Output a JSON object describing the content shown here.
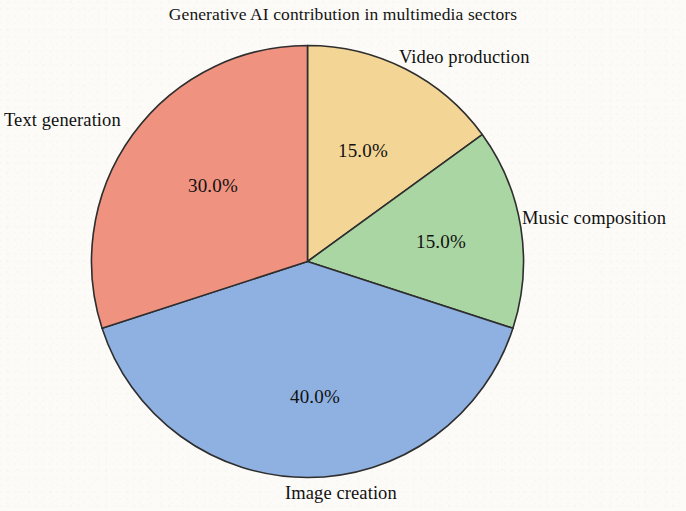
{
  "chart_data": {
    "type": "pie",
    "title": "Generative AI contribution in multimedia sectors",
    "xlabel": "",
    "ylabel": "",
    "legend_position": "none",
    "grid": false,
    "start_angle_deg": 90,
    "direction": "clockwise",
    "categories": [
      "Video production",
      "Music composition",
      "Image creation",
      "Text generation"
    ],
    "values": [
      15.0,
      15.0,
      40.0,
      30.0
    ],
    "value_labels": [
      "15.0%",
      "15.0%",
      "40.0%",
      "30.0%"
    ],
    "colors": [
      "#f3d595",
      "#a9d6a2",
      "#8fb1e1",
      "#ef9280"
    ],
    "slices": [
      {
        "label": "Video production",
        "value": 15.0,
        "value_label": "15.0%",
        "color": "#f3d595",
        "start_deg": 0,
        "end_deg": 54
      },
      {
        "label": "Music composition",
        "value": 15.0,
        "value_label": "15.0%",
        "color": "#a9d6a2",
        "start_deg": 54,
        "end_deg": 108
      },
      {
        "label": "Image creation",
        "value": 40.0,
        "value_label": "40.0%",
        "color": "#8fb1e1",
        "start_deg": 108,
        "end_deg": 252
      },
      {
        "label": "Text generation",
        "value": 30.0,
        "value_label": "30.0%",
        "color": "#ef9280",
        "start_deg": 252,
        "end_deg": 360
      }
    ]
  },
  "figure": {
    "title": "Generative AI contribution in multimedia sectors",
    "background_color": "#fcfbf8",
    "edge_color": "#2e2e2e"
  },
  "labels": {
    "text_generation": "Text generation",
    "video_production": "Video production",
    "music_composition": "Music composition",
    "image_creation": "Image creation"
  },
  "percentages": {
    "video_production": "15.0%",
    "music_composition": "15.0%",
    "image_creation": "40.0%",
    "text_generation": "30.0%"
  }
}
